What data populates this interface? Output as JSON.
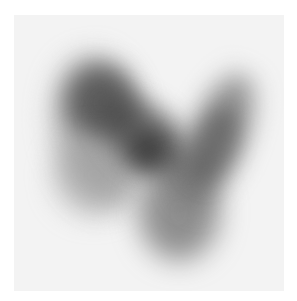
{
  "image": {
    "description": "Grayscale scintigraphy-style image showing a blurred dark V-shaped uptake pattern on a light gray square background",
    "colors": {
      "page_background": "#ffffff",
      "panel_background": "#f3f3f3",
      "uptake_dark": "#4a4a4a",
      "uptake_mid": "#7a7a7a",
      "uptake_light": "#b0b0b0"
    },
    "regions": [
      {
        "name": "left-lobe-upper",
        "intensity": "dark"
      },
      {
        "name": "left-lobe-lower",
        "intensity": "light"
      },
      {
        "name": "isthmus-center",
        "intensity": "darkest"
      },
      {
        "name": "right-lobe",
        "intensity": "mid"
      },
      {
        "name": "lower-apex",
        "intensity": "mid"
      }
    ]
  }
}
